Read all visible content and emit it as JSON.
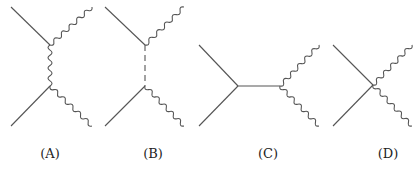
{
  "figure": {
    "line_color": "#555555",
    "panels": [
      {
        "label": "(A)",
        "label_x": 50,
        "propagator": "wavy",
        "lines": [
          {
            "type": "straight",
            "from": [
              11,
              7
            ],
            "to": [
              50,
              45
            ]
          },
          {
            "type": "straight",
            "from": [
              11,
              126
            ],
            "to": [
              50,
              86
            ]
          },
          {
            "type": "wavy",
            "from": [
              50,
              45
            ],
            "to": [
              92,
              7
            ]
          },
          {
            "type": "wavy",
            "from": [
              50,
              86
            ],
            "to": [
              92,
              126
            ]
          },
          {
            "type": "wavy",
            "from": [
              50,
              45
            ],
            "to": [
              50,
              86
            ]
          }
        ]
      },
      {
        "label": "(B)",
        "label_x": 153,
        "propagator": "dashed",
        "lines": [
          {
            "type": "straight",
            "from": [
              105,
              7
            ],
            "to": [
              145,
              45
            ]
          },
          {
            "type": "straight",
            "from": [
              105,
              126
            ],
            "to": [
              145,
              86
            ]
          },
          {
            "type": "wavy",
            "from": [
              145,
              45
            ],
            "to": [
              184,
              7
            ]
          },
          {
            "type": "wavy",
            "from": [
              145,
              86
            ],
            "to": [
              184,
              126
            ]
          },
          {
            "type": "dashed",
            "from": [
              145,
              45
            ],
            "to": [
              145,
              86
            ]
          }
        ]
      },
      {
        "label": "(C)",
        "label_x": 268,
        "propagator": "straight",
        "lines": [
          {
            "type": "straight",
            "from": [
              199,
              45
            ],
            "to": [
              238,
              86
            ]
          },
          {
            "type": "straight",
            "from": [
              199,
              126
            ],
            "to": [
              238,
              86
            ]
          },
          {
            "type": "straight",
            "from": [
              238,
              86
            ],
            "to": [
              280,
              86
            ]
          },
          {
            "type": "wavy",
            "from": [
              280,
              86
            ],
            "to": [
              319,
              45
            ]
          },
          {
            "type": "wavy",
            "from": [
              280,
              86
            ],
            "to": [
              319,
              126
            ]
          }
        ]
      },
      {
        "label": "(D)",
        "label_x": 388,
        "propagator": "contact",
        "lines": [
          {
            "type": "straight",
            "from": [
              333,
              45
            ],
            "to": [
              373,
              85
            ]
          },
          {
            "type": "straight",
            "from": [
              333,
              126
            ],
            "to": [
              373,
              85
            ]
          },
          {
            "type": "wavy",
            "from": [
              373,
              85
            ],
            "to": [
              412,
              45
            ]
          },
          {
            "type": "wavy",
            "from": [
              373,
              85
            ],
            "to": [
              412,
              126
            ]
          }
        ]
      }
    ]
  }
}
